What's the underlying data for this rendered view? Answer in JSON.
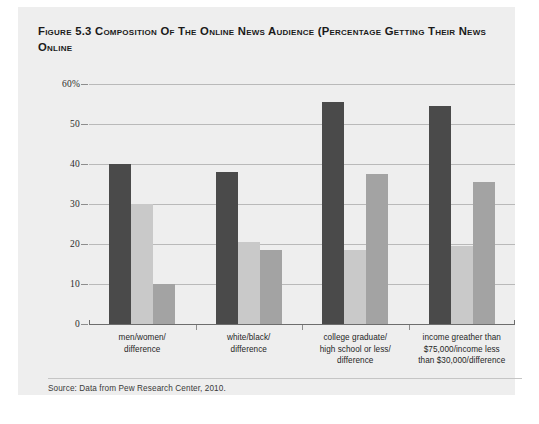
{
  "figure": {
    "title_line1": "Figure 5.3 Composition of the Online News Audience (Percentage Getting",
    "title_line2": "Their News Online",
    "source_note": "Source: Data from Pew Research Center, 2010."
  },
  "colors": {
    "panel_background": "#eeeeee",
    "series_dark": "#4a4a4a",
    "series_light": "#c9c9c9",
    "series_medium": "#a3a3a3",
    "gridline": "#b9b9b9",
    "axis": "#6d6d6d",
    "title_text": "#1a1a1a",
    "label_text": "#1f1f1f"
  },
  "chart_data": {
    "type": "bar",
    "title": "Figure 5.3 Composition of the Online News Audience (Percentage Getting Their News Online",
    "xlabel": "",
    "ylabel": "",
    "ylim": [
      0,
      60
    ],
    "yticks": [
      0,
      10,
      20,
      30,
      40,
      50,
      60
    ],
    "ytick_labels": [
      "0",
      "10",
      "20",
      "30",
      "40",
      "50",
      "60%"
    ],
    "grid": true,
    "legend": "none",
    "categories": [
      "men/women/\ndifference",
      "white/black/\ndifference",
      "college graduate/\nhigh school or less/\ndifference",
      "income greather than\n$75,000/income less\nthan $30,000/difference"
    ],
    "category_lines": [
      [
        "men/women/",
        "difference"
      ],
      [
        "white/black/",
        "difference"
      ],
      [
        "college graduate/",
        "high school or less/",
        "difference"
      ],
      [
        "income greather than",
        "$75,000/income less",
        "than $30,000/difference"
      ]
    ],
    "series": [
      {
        "name": "first",
        "color": "#4a4a4a",
        "values": [
          40,
          38,
          55.5,
          54.5
        ]
      },
      {
        "name": "second",
        "color": "#c9c9c9",
        "values": [
          30,
          20.5,
          18.5,
          19.5
        ]
      },
      {
        "name": "difference",
        "color": "#a3a3a3",
        "values": [
          10,
          18.5,
          37.5,
          35.5
        ]
      }
    ]
  }
}
